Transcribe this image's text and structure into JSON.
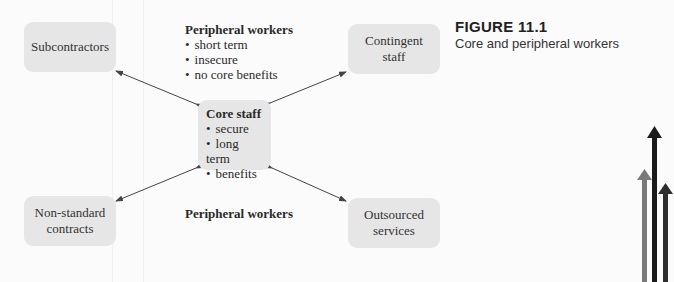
{
  "figure": {
    "number": "FIGURE 11.1",
    "caption": "Core and peripheral workers"
  },
  "core": {
    "title": "Core staff",
    "items": [
      "secure",
      "long term",
      "benefits"
    ]
  },
  "peripheral_top": {
    "title": "Peripheral workers",
    "items": [
      "short term",
      "insecure",
      "no core benefits"
    ]
  },
  "peripheral_bottom": {
    "title": "Peripheral workers"
  },
  "nodes": {
    "subcontractors": "Subcontractors",
    "contingent_line1": "Contingent",
    "contingent_line2": "staff",
    "nonstandard_line1": "Non-standard",
    "nonstandard_line2": "contracts",
    "outsourced_line1": "Outsourced",
    "outsourced_line2": "services"
  },
  "colors": {
    "box_fill": "#e6e6e6",
    "arrow": "#444444",
    "deco_arrow_grey": "#7a7a7a",
    "deco_arrow_dark": "#1a1a1a",
    "deco_arrow_darkgrey": "#2e2e2e"
  }
}
